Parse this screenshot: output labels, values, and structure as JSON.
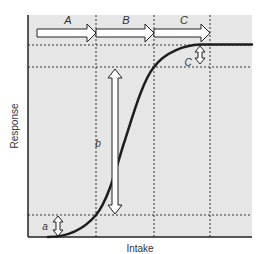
{
  "diagram": {
    "type": "dose-response sigmoid curve",
    "xlabel": "Intake",
    "ylabel": "Response",
    "phase_labels": [
      "A",
      "B",
      "C"
    ],
    "range_labels": {
      "a": "a",
      "b": "b",
      "c": "C"
    },
    "colors": {
      "background": "#e6e6e6",
      "curve": "#1e1e1e",
      "axis": "#222222",
      "grid": "#333333",
      "arrow_fill": "#ffffff",
      "arrow_stroke": "#222222",
      "text": "#333333"
    }
  }
}
